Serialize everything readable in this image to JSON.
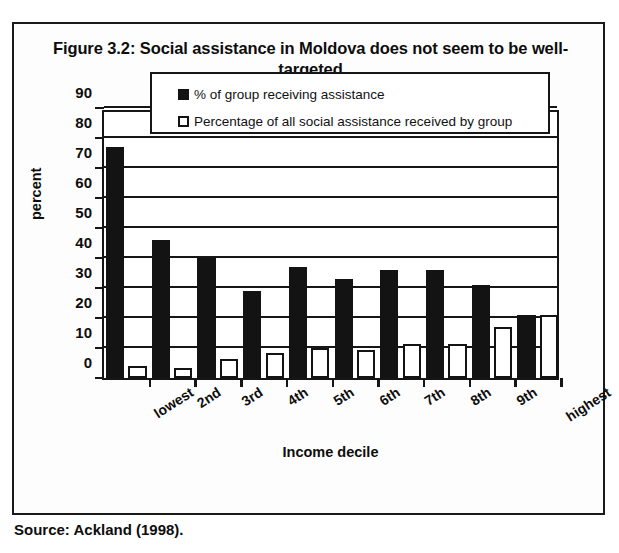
{
  "figure": {
    "title": "Figure 3.2: Social assistance in Moldova does not seem to be well-targeted",
    "source_note": "Source: Ackland (1998)."
  },
  "chart_data": {
    "type": "bar",
    "title": "Figure 3.2: Social assistance in Moldova does not seem to be well-targeted",
    "xlabel": "Income decile",
    "ylabel": "percent",
    "ylim": [
      0,
      90
    ],
    "ytick_step": 10,
    "yticks": [
      0,
      10,
      20,
      30,
      40,
      50,
      60,
      70,
      80,
      90
    ],
    "grid": true,
    "legend_position": "top-center-inside",
    "categories": [
      "lowest",
      "2nd",
      "3rd",
      "4th",
      "5th",
      "6th",
      "7th",
      "8th",
      "9th",
      "highest"
    ],
    "series": [
      {
        "name": "% of group receiving assistance",
        "color": "#131313",
        "style": "filled",
        "values": [
          77,
          46,
          40,
          29,
          37,
          33,
          36,
          36,
          31,
          21
        ]
      },
      {
        "name": "Percentage of all social assistance received by group",
        "color": "#ffffff",
        "style": "outlined",
        "values": [
          4,
          3.5,
          6.5,
          8.5,
          10,
          9.5,
          11.5,
          11.5,
          17,
          21
        ]
      }
    ]
  },
  "colors": {
    "ink": "#131313",
    "paper": "#ffffff"
  }
}
